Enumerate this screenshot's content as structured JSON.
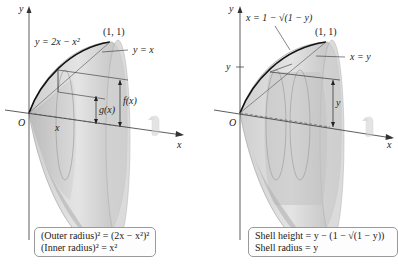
{
  "left_panel": {
    "axis_y_label": "y",
    "axis_x_label": "x",
    "origin_label": "O",
    "curve_label": "y = 2x − x²",
    "line_label": "y = x",
    "point_label": "(1, 1)",
    "inner_label": "g(x)",
    "outer_label": "f(x)",
    "x_tick_label": "x",
    "caption": {
      "line1": "(Outer radius)² = (2x − x²)²",
      "line2": "(Inner radius)² = x²"
    }
  },
  "right_panel": {
    "axis_y_label": "y",
    "axis_x_label": "x",
    "origin_label": "O",
    "curve_label": "x = 1 − √(1 − y)",
    "line_label": "x = y",
    "point_label": "(1, 1)",
    "y_tick_label": "y",
    "height_label": "y",
    "caption": {
      "line1": "Shell height = y − (1 − √(1 − y))",
      "line2": "Shell radius = y"
    }
  },
  "colors": {
    "solid_light": "#e6e6e6",
    "solid_mid": "#c8c8c8",
    "solid_dark": "#a9a9a9",
    "curve": "#111111",
    "axis": "#333333"
  }
}
